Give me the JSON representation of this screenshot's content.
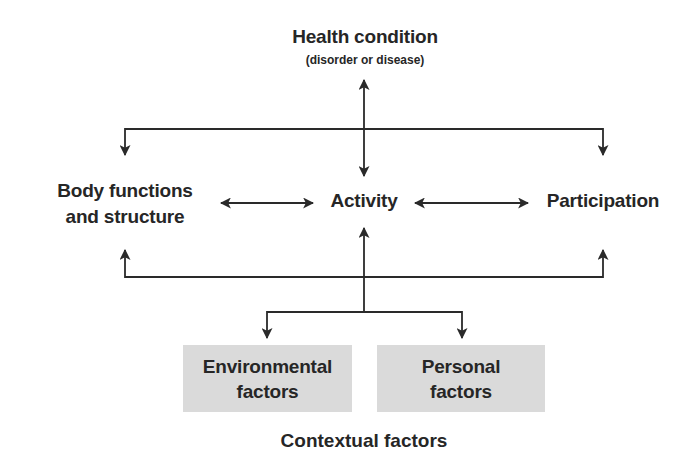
{
  "diagram": {
    "health_condition": {
      "label": "Health condition",
      "sublabel": "(disorder or disease)"
    },
    "body_functions": {
      "line1": "Body functions",
      "line2": "and structure"
    },
    "activity": {
      "label": "Activity"
    },
    "participation": {
      "label": "Participation"
    },
    "environmental_factors": {
      "line1": "Environmental",
      "line2": "factors"
    },
    "personal_factors": {
      "line1": "Personal",
      "line2": "factors"
    },
    "contextual_factors": {
      "label": "Contextual factors"
    },
    "colors": {
      "text": "#262626",
      "line": "#2a2a2a",
      "box_fill": "#dadada",
      "background": "#ffffff"
    },
    "connections": [
      {
        "from": "Health condition",
        "to": "Activity",
        "direction": "both"
      },
      {
        "from": "Health condition",
        "to": "Body functions and structure",
        "direction": "to"
      },
      {
        "from": "Health condition",
        "to": "Participation",
        "direction": "to"
      },
      {
        "from": "Body functions and structure",
        "to": "Activity",
        "direction": "both"
      },
      {
        "from": "Activity",
        "to": "Participation",
        "direction": "both"
      },
      {
        "from": "Contextual factors",
        "to": "Activity",
        "direction": "to"
      },
      {
        "from": "Contextual factors",
        "to": "Body functions and structure",
        "direction": "to"
      },
      {
        "from": "Contextual factors",
        "to": "Participation",
        "direction": "to"
      },
      {
        "from": "Activity",
        "to": "Environmental factors",
        "direction": "to"
      },
      {
        "from": "Activity",
        "to": "Personal factors",
        "direction": "to"
      }
    ]
  }
}
